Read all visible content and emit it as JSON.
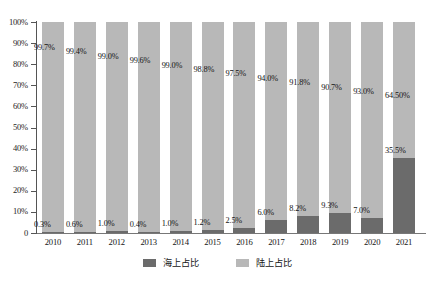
{
  "chart_data": {
    "type": "bar",
    "subtype": "stacked-bar-100",
    "title": "",
    "subtitle": "",
    "xlabel": "",
    "ylabel": "",
    "categories": [
      "2010",
      "2011",
      "2012",
      "2013",
      "2014",
      "2015",
      "2016",
      "2017",
      "2018",
      "2019",
      "2020",
      "2021"
    ],
    "series": [
      {
        "name": "海上占比",
        "color": "#6b6b6b",
        "values": [
          0.3,
          0.6,
          1.0,
          0.4,
          1.0,
          1.2,
          2.5,
          6.0,
          8.2,
          9.3,
          7.0,
          35.5
        ],
        "labels": [
          "0.3%",
          "0.6%",
          "1.0%",
          "0.4%",
          "1.0%",
          "1.2%",
          "2.5%",
          "6.0%",
          "8.2%",
          "9.3%",
          "7.0%",
          "35.5%"
        ]
      },
      {
        "name": "陆上占比",
        "color": "#b8b8b8",
        "values": [
          99.7,
          99.4,
          99.0,
          99.6,
          99.0,
          98.8,
          97.5,
          94.0,
          91.8,
          90.7,
          93.0,
          64.5
        ],
        "labels": [
          "99.7%",
          "99.4%",
          "99.0%",
          "99.6%",
          "99.0%",
          "98.8%",
          "97.5%",
          "94.0%",
          "91.8%",
          "90.7%",
          "93.0%",
          "64.50%"
        ]
      }
    ],
    "ylim": [
      0,
      100
    ],
    "yticks": [
      0,
      10,
      20,
      30,
      40,
      50,
      60,
      70,
      80,
      90,
      100
    ],
    "ytick_labels": [
      "0",
      "10%",
      "20%",
      "30%",
      "40%",
      "50%",
      "60%",
      "70%",
      "80%",
      "90%",
      "100%"
    ],
    "grid": false,
    "legend_position": "bottom"
  },
  "legend": {
    "items": [
      {
        "label": "海上占比",
        "color": "#6b6b6b"
      },
      {
        "label": "陆上占比",
        "color": "#b8b8b8"
      }
    ]
  },
  "colors": {
    "offshore": "#6b6b6b",
    "onshore": "#b8b8b8",
    "axis": "#555555",
    "text": "#141414",
    "background": "#ffffff"
  }
}
